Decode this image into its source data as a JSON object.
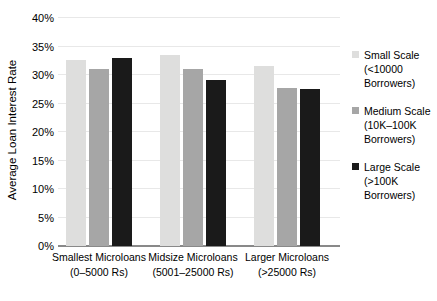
{
  "chart_data": {
    "type": "bar",
    "title": "",
    "xlabel": "",
    "ylabel": "Average Loan Interest Rate",
    "ylim": [
      0,
      40
    ],
    "ytick_labels": [
      "40%",
      "35%",
      "30%",
      "25%",
      "20%",
      "15%",
      "10%",
      "5%",
      "0%"
    ],
    "ytick_values": [
      40,
      35,
      30,
      25,
      20,
      15,
      10,
      5,
      0
    ],
    "grid": true,
    "legend_position": "right",
    "categories": [
      {
        "line1": "Smallest Microloans",
        "line2": "(0–5000 Rs)"
      },
      {
        "line1": "Midsize Microloans",
        "line2": "(5001–25000 Rs)"
      },
      {
        "line1": "Larger Microloans",
        "line2": "(>25000 Rs)"
      }
    ],
    "series": [
      {
        "name": "Small Scale",
        "legend_line1": "Small Scale",
        "legend_line2": "(<10000",
        "legend_line3": "Borrowers)",
        "color": "#dededd",
        "values": [
          32.6,
          33.5,
          31.5
        ]
      },
      {
        "name": "Medium Scale",
        "legend_line1": "Medium Scale",
        "legend_line2": "(10K–100K",
        "legend_line3": "Borrowers)",
        "color": "#a6a6a6",
        "values": [
          31.1,
          31.0,
          27.7
        ]
      },
      {
        "name": "Large Scale",
        "legend_line1": "Large Scale",
        "legend_line2": "(>100K",
        "legend_line3": "Borrowers)",
        "color": "#1a1a1a",
        "values": [
          32.9,
          29.2,
          27.6
        ]
      }
    ]
  }
}
